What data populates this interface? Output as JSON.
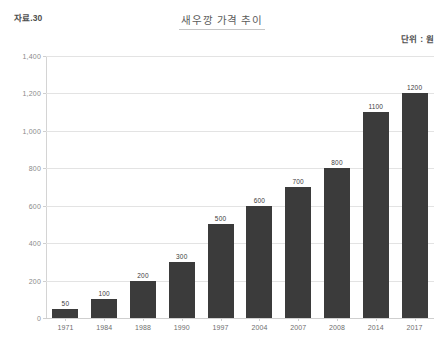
{
  "header": {
    "source_label": "자료.30",
    "title": "새우깡 가격 추이",
    "unit_label": "단위 : 원"
  },
  "chart_data": {
    "type": "bar",
    "title": "새우깡 가격 추이",
    "xlabel": "",
    "ylabel": "",
    "unit": "원",
    "categories": [
      "1971",
      "1984",
      "1988",
      "1990",
      "1997",
      "2004",
      "2007",
      "2008",
      "2014",
      "2017"
    ],
    "values": [
      50,
      100,
      200,
      300,
      500,
      600,
      700,
      800,
      1100,
      1200
    ],
    "value_labels": [
      "50",
      "100",
      "200",
      "300",
      "500",
      "600",
      "700",
      "800",
      "1100",
      "1200"
    ],
    "ylim": [
      0,
      1400
    ],
    "ytick_values": [
      0,
      200,
      400,
      600,
      800,
      1000,
      1200,
      1400
    ],
    "ytick_labels": [
      "0",
      "200",
      "400",
      "600",
      "800",
      "1,000",
      "1,200",
      "1,400"
    ],
    "grid": true,
    "legend": false,
    "bar_color": "#3b3b3b",
    "grid_color": "#e3e3e3",
    "background": "#ffffff"
  }
}
